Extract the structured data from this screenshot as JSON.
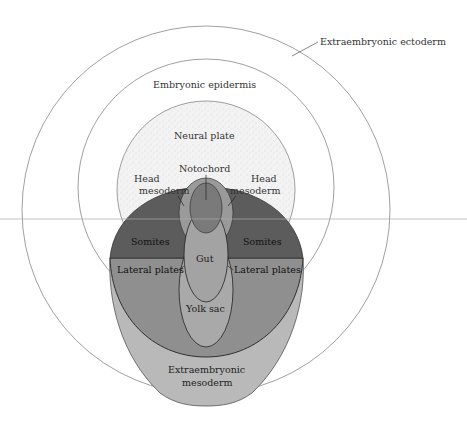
{
  "diagram": {
    "type": "embryonic fate map",
    "labels": {
      "extraembryonic_ectoderm": "Extraembryonic ectoderm",
      "embryonic_epidermis": "Embryonic epidermis",
      "neural_plate": "Neural plate",
      "notochord": "Notochord",
      "head_mesoderm_left_1": "Head",
      "head_mesoderm_left_2": "mesoderm",
      "head_mesoderm_right_1": "Head",
      "head_mesoderm_right_2": "mesoderm",
      "somites_left": "Somites",
      "somites_right": "Somites",
      "gut": "Gut",
      "lateral_plates_left": "Lateral plates",
      "lateral_plates_right": "Lateral plates",
      "yolk_sac": "Yolk sac",
      "extraembryonic_mesoderm_1": "Extraembryonic",
      "extraembryonic_mesoderm_2": "mesoderm"
    },
    "colors": {
      "background": "#ffffff",
      "outline": "#666666",
      "neural_plate_fill": "#f1f1f1",
      "somites_fill": "#5c5c5c",
      "lateral_plates_fill": "#8f8f8f",
      "extraembryonic_mesoderm_fill": "#b9b9b9",
      "notochord_fill": "#7a7a7a",
      "head_mesoderm_fill": "#9a9a9a",
      "gut_fill": "#a3a3a3",
      "yolk_sac_fill": "#a9a9a9"
    }
  }
}
